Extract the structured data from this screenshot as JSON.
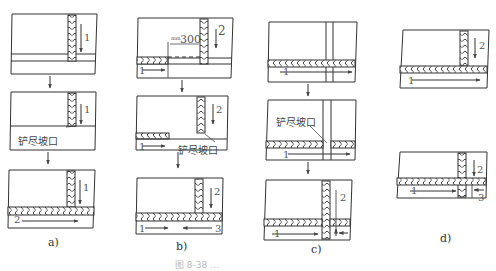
{
  "figure": {
    "caption_partial": "图 8-38 …",
    "annotation_bevel": "铲尽坡口",
    "dimension_label": "300",
    "dimension_prefix": "mm",
    "line_color": "#333333",
    "panels": [
      {
        "id": "a",
        "label": "a)",
        "steps": [
          {
            "weld_order_labels": [
              "1"
            ]
          },
          {
            "weld_order_labels": [
              "1"
            ],
            "note": "铲尽坡口"
          },
          {
            "weld_order_labels": [
              "1",
              "2"
            ]
          }
        ]
      },
      {
        "id": "b",
        "label": "b)",
        "steps": [
          {
            "weld_order_labels": [
              "2",
              "1"
            ],
            "dimension": "300"
          },
          {
            "weld_order_labels": [
              "2",
              "1"
            ],
            "note": "铲尽坡口"
          },
          {
            "weld_order_labels": [
              "2",
              "1",
              "3"
            ]
          }
        ]
      },
      {
        "id": "c",
        "label": "c)",
        "steps": [
          {
            "weld_order_labels": [
              "1"
            ]
          },
          {
            "weld_order_labels": [
              "1"
            ],
            "note": "铲尽坡口"
          },
          {
            "weld_order_labels": [
              "2",
              "1"
            ]
          }
        ]
      },
      {
        "id": "d",
        "label": "d)",
        "steps": [
          {
            "weld_order_labels": [
              "2",
              "1"
            ]
          },
          {
            "weld_order_labels": [
              "2",
              "1",
              "3"
            ]
          }
        ]
      }
    ]
  }
}
